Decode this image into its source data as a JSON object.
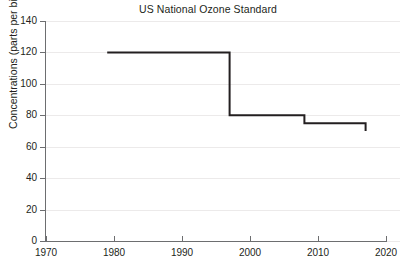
{
  "chart_data": {
    "type": "line",
    "subtype": "step-post",
    "title": "US National Ozone Standard",
    "xlabel": "",
    "ylabel": "Concentrations (parts per billion)",
    "xlim": [
      1970,
      2020
    ],
    "ylim": [
      0,
      140
    ],
    "xticks": [
      1970,
      1980,
      1990,
      2000,
      2010,
      2020
    ],
    "yticks": [
      0,
      20,
      40,
      60,
      80,
      100,
      120,
      140
    ],
    "grid": "horizontal",
    "legend": "none",
    "line_color": "#231f20",
    "grid_color": "#eceaea",
    "axis_color": "#6d6e70",
    "x": [
      1979,
      1997,
      2008,
      2017
    ],
    "values": [
      120,
      80,
      75,
      70
    ],
    "series": [
      {
        "name": "US National Ozone Standard",
        "steps": [
          {
            "year_start": 1979,
            "year_end": 1997,
            "value": 120
          },
          {
            "year_start": 1997,
            "year_end": 2008,
            "value": 80
          },
          {
            "year_start": 2008,
            "year_end": 2017,
            "value": 75
          },
          {
            "year_start": 2017,
            "year_end": 2017,
            "value": 70
          }
        ]
      }
    ]
  },
  "axis": {
    "y_tick_labels": [
      "140",
      "120",
      "100",
      "80",
      "60",
      "40",
      "20",
      "0"
    ],
    "x_tick_labels": [
      "1970",
      "1980",
      "1990",
      "2000",
      "2010",
      "2020"
    ]
  }
}
